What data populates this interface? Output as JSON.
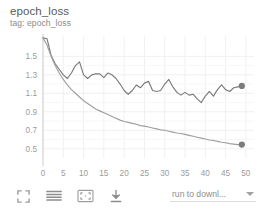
{
  "card": {
    "title": "epoch_loss",
    "subtitle": "tag: epoch_loss"
  },
  "toolbar": {
    "fullscreen_label": "fit-to-screen",
    "datatable_label": "toggle-data-table",
    "resetzoom_label": "reset-zoom",
    "download_label": "download-image",
    "download_select_value": "run to downl...",
    "caret_label": "chevron-down"
  },
  "colors": {
    "line_train": "#9e9e9e",
    "line_val": "#7b7b7b",
    "marker": "#7b7b7b",
    "grid": "#f0f0f0",
    "axis": "#cfcfcf",
    "tick_text": "#9b9b9b",
    "title_text": "#5a5a5a",
    "subtitle_text": "#8a8a8a",
    "card_bg": "#ffffff"
  },
  "chart_data": {
    "type": "line",
    "title": "epoch_loss",
    "subtitle": "tag: epoch_loss",
    "xlabel": "",
    "ylabel": "",
    "xlim": [
      0,
      52
    ],
    "ylim": [
      0.4,
      1.72
    ],
    "xticks": [
      0,
      5,
      10,
      15,
      20,
      25,
      30,
      35,
      40,
      45,
      50
    ],
    "yticks": [
      0.5,
      0.7,
      0.9,
      1.1,
      1.3,
      1.5
    ],
    "grid": true,
    "legend": "none",
    "end_markers": true,
    "series": [
      {
        "name": "validation",
        "color": "#7b7b7b",
        "marker_end": true,
        "x": [
          0,
          1,
          2,
          3,
          4,
          5,
          6,
          7,
          8,
          9,
          10,
          11,
          12,
          13,
          14,
          15,
          16,
          17,
          18,
          19,
          20,
          21,
          22,
          23,
          24,
          25,
          26,
          27,
          28,
          29,
          30,
          31,
          32,
          33,
          34,
          35,
          36,
          37,
          38,
          39,
          40,
          41,
          42,
          43,
          44,
          45,
          46,
          47,
          48,
          49
        ],
        "y": [
          1.7,
          1.69,
          1.51,
          1.42,
          1.36,
          1.3,
          1.26,
          1.32,
          1.4,
          1.44,
          1.3,
          1.26,
          1.3,
          1.31,
          1.31,
          1.27,
          1.32,
          1.3,
          1.26,
          1.2,
          1.13,
          1.09,
          1.13,
          1.19,
          1.16,
          1.21,
          1.23,
          1.13,
          1.12,
          1.13,
          1.2,
          1.25,
          1.17,
          1.11,
          1.08,
          1.11,
          1.08,
          1.09,
          1.04,
          1.0,
          1.07,
          1.12,
          1.07,
          1.14,
          1.19,
          1.14,
          1.12,
          1.16,
          1.17,
          1.18
        ]
      },
      {
        "name": "train",
        "color": "#9e9e9e",
        "marker_end": true,
        "x": [
          0,
          1,
          2,
          3,
          4,
          5,
          6,
          7,
          8,
          9,
          10,
          11,
          12,
          13,
          14,
          15,
          16,
          17,
          18,
          19,
          20,
          21,
          22,
          23,
          24,
          25,
          26,
          27,
          28,
          29,
          30,
          31,
          32,
          33,
          34,
          35,
          36,
          37,
          38,
          39,
          40,
          41,
          42,
          43,
          44,
          45,
          46,
          47,
          48,
          49
        ],
        "y": [
          1.7,
          1.62,
          1.5,
          1.4,
          1.32,
          1.25,
          1.19,
          1.14,
          1.1,
          1.06,
          1.02,
          0.99,
          0.96,
          0.93,
          0.91,
          0.89,
          0.87,
          0.85,
          0.83,
          0.81,
          0.795,
          0.785,
          0.775,
          0.765,
          0.75,
          0.745,
          0.735,
          0.725,
          0.715,
          0.705,
          0.7,
          0.69,
          0.68,
          0.67,
          0.665,
          0.655,
          0.645,
          0.635,
          0.625,
          0.615,
          0.605,
          0.595,
          0.59,
          0.58,
          0.57,
          0.565,
          0.555,
          0.55,
          0.545,
          0.545
        ]
      }
    ]
  }
}
